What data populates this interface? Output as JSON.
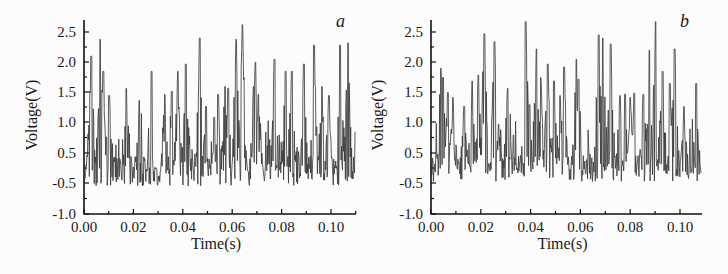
{
  "figure": {
    "background": "#fcfcfc",
    "trace_color": "#3a3a3a",
    "axis_color": "#111111"
  },
  "chart_data": [
    {
      "type": "line",
      "panel_label": "a",
      "title": "",
      "xlabel": "Time(s)",
      "ylabel": "Voltage(V)",
      "xlim": [
        0.0,
        0.11
      ],
      "ylim_printed": [
        -1.0,
        2.7
      ],
      "x_ticks": [
        "0.00",
        "0.02",
        "0.04",
        "0.06",
        "0.08",
        "0.10"
      ],
      "x_tick_values": [
        0.0,
        0.02,
        0.04,
        0.06,
        0.08,
        0.1
      ],
      "y_ticks": [
        "2.5",
        "2.0",
        "1.5",
        "1.0",
        "0.5",
        "-0.5",
        "-1.0"
      ],
      "grid": false,
      "legend": null,
      "baseline_voltage": 0.2,
      "noise_amplitude": 0.25,
      "seed": 17,
      "peaks": [
        {
          "t": 0.0029,
          "v": 2.1
        },
        {
          "t": 0.0066,
          "v": 2.38
        },
        {
          "t": 0.0078,
          "v": 1.85
        },
        {
          "t": 0.0102,
          "v": 1.45
        },
        {
          "t": 0.0171,
          "v": 1.57
        },
        {
          "t": 0.0224,
          "v": 1.37
        },
        {
          "t": 0.0273,
          "v": 1.85
        },
        {
          "t": 0.0327,
          "v": 1.47
        },
        {
          "t": 0.0355,
          "v": 1.52
        },
        {
          "t": 0.038,
          "v": 1.85
        },
        {
          "t": 0.0412,
          "v": 1.97
        },
        {
          "t": 0.0469,
          "v": 2.4
        },
        {
          "t": 0.0494,
          "v": 1.27
        },
        {
          "t": 0.0527,
          "v": 1.09
        },
        {
          "t": 0.0543,
          "v": 1.47
        },
        {
          "t": 0.0571,
          "v": 1.6
        },
        {
          "t": 0.0584,
          "v": 1.57
        },
        {
          "t": 0.0616,
          "v": 2.38
        },
        {
          "t": 0.0641,
          "v": 2.62
        },
        {
          "t": 0.0686,
          "v": 1.6
        },
        {
          "t": 0.0694,
          "v": 2.0
        },
        {
          "t": 0.0706,
          "v": 1.47
        },
        {
          "t": 0.0771,
          "v": 2.05
        },
        {
          "t": 0.0816,
          "v": 1.85
        },
        {
          "t": 0.0841,
          "v": 1.85
        },
        {
          "t": 0.089,
          "v": 1.97
        },
        {
          "t": 0.0931,
          "v": 2.28
        },
        {
          "t": 0.0963,
          "v": 1.6
        },
        {
          "t": 0.0992,
          "v": 1.45
        },
        {
          "t": 0.1037,
          "v": 2.28
        },
        {
          "t": 0.1069,
          "v": 2.32
        }
      ]
    },
    {
      "type": "line",
      "panel_label": "b",
      "title": "",
      "xlabel": "Time(s)",
      "ylabel": "Voltage(V)",
      "xlim": [
        0.0,
        0.11
      ],
      "ylim_printed": [
        -1.0,
        2.7
      ],
      "x_ticks": [
        "0.00",
        "0.02",
        "0.04",
        "0.06",
        "0.08",
        "0.10"
      ],
      "x_tick_values": [
        0.0,
        0.02,
        0.04,
        0.06,
        0.08,
        0.1
      ],
      "y_ticks": [
        "2.5",
        "2.0",
        "1.5",
        "1.0",
        "0.5",
        "-0.5",
        "-1.0"
      ],
      "grid": false,
      "legend": null,
      "baseline_voltage": 0.25,
      "noise_amplitude": 0.22,
      "seed": 41,
      "peaks": [
        {
          "t": 0.004,
          "v": 1.9
        },
        {
          "t": 0.0048,
          "v": 1.75
        },
        {
          "t": 0.0068,
          "v": 1.5
        },
        {
          "t": 0.0088,
          "v": 1.42
        },
        {
          "t": 0.0133,
          "v": 1.27
        },
        {
          "t": 0.0165,
          "v": 1.69
        },
        {
          "t": 0.019,
          "v": 1.79
        },
        {
          "t": 0.0214,
          "v": 2.47
        },
        {
          "t": 0.0255,
          "v": 2.34
        },
        {
          "t": 0.0271,
          "v": 0.98
        },
        {
          "t": 0.0308,
          "v": 1.57
        },
        {
          "t": 0.0331,
          "v": 0.8
        },
        {
          "t": 0.038,
          "v": 2.67
        },
        {
          "t": 0.0396,
          "v": 1.3
        },
        {
          "t": 0.0424,
          "v": 2.22
        },
        {
          "t": 0.0441,
          "v": 1.75
        },
        {
          "t": 0.0469,
          "v": 1.97
        },
        {
          "t": 0.0494,
          "v": 1.69
        },
        {
          "t": 0.0518,
          "v": 1.45
        },
        {
          "t": 0.0535,
          "v": 1.92
        },
        {
          "t": 0.0584,
          "v": 2.05
        },
        {
          "t": 0.0592,
          "v": 1.72
        },
        {
          "t": 0.0673,
          "v": 2.45
        },
        {
          "t": 0.069,
          "v": 2.4
        },
        {
          "t": 0.0722,
          "v": 2.3
        },
        {
          "t": 0.0759,
          "v": 1.45
        },
        {
          "t": 0.078,
          "v": 1.47
        },
        {
          "t": 0.08,
          "v": 1.42
        },
        {
          "t": 0.0816,
          "v": 1.49
        },
        {
          "t": 0.0853,
          "v": 1.47
        },
        {
          "t": 0.0877,
          "v": 2.2
        },
        {
          "t": 0.0902,
          "v": 2.67
        },
        {
          "t": 0.093,
          "v": 1.85
        },
        {
          "t": 0.0959,
          "v": 1.65
        },
        {
          "t": 0.0978,
          "v": 2.22
        },
        {
          "t": 0.1016,
          "v": 1.27
        },
        {
          "t": 0.1065,
          "v": 1.65
        }
      ]
    }
  ]
}
